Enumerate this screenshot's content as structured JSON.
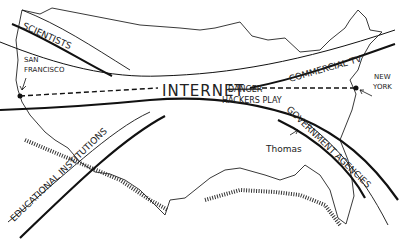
{
  "cartoon": {
    "center_label": "INTERNET",
    "danger_label": "DANGER",
    "danger_sub": "HACKERS PLAY",
    "san_francisco": [
      "SAN",
      "FRANCISCO"
    ],
    "new_york": [
      "NEW",
      "YORK"
    ],
    "thomas": "Thomas",
    "branches": {
      "scientists": "SCIENTISTS",
      "commercial_tv": "COMMERCIAL TV",
      "educational": "EDUCATIONAL INSTITUTIONS",
      "government": "GOVERNMENT AGENCIES"
    },
    "colors": {
      "ink": "#1a1a1a",
      "paper": "#ffffff"
    }
  }
}
